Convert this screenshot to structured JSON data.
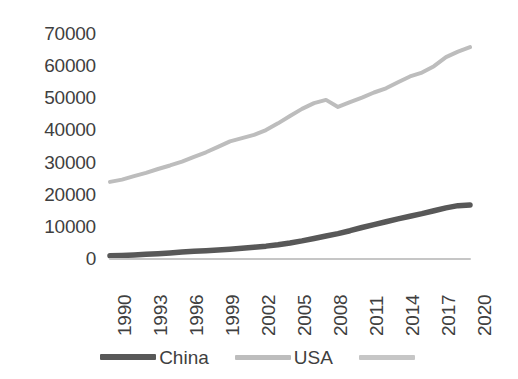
{
  "chart_data": {
    "type": "line",
    "title": "",
    "xlabel": "",
    "ylabel": "",
    "xlim": [
      1990,
      2020
    ],
    "ylim": [
      0,
      70000
    ],
    "grid": false,
    "legend_position": "bottom",
    "y_ticks": [
      70000,
      60000,
      50000,
      40000,
      30000,
      20000,
      10000,
      0
    ],
    "y_tick_labels": [
      "70000",
      "60000",
      "50000",
      "40000",
      "30000",
      "20000",
      "10000",
      "0"
    ],
    "x_ticks": [
      1990,
      1993,
      1996,
      1999,
      2002,
      2005,
      2008,
      2011,
      2014,
      2017,
      2020
    ],
    "x_tick_labels": [
      "1990",
      "1993",
      "1996",
      "1999",
      "2002",
      "2005",
      "2008",
      "2011",
      "2014",
      "2017",
      "2020"
    ],
    "x": [
      1990,
      1991,
      1992,
      1993,
      1994,
      1995,
      1996,
      1997,
      1998,
      1999,
      2000,
      2001,
      2002,
      2003,
      2004,
      2005,
      2006,
      2007,
      2008,
      2009,
      2010,
      2011,
      2012,
      2013,
      2014,
      2015,
      2016,
      2017,
      2018,
      2019,
      2020
    ],
    "series": [
      {
        "name": "China",
        "color": "#585858",
        "values": [
          1000,
          1100,
          1250,
          1450,
          1650,
          1900,
          2150,
          2400,
          2600,
          2800,
          3050,
          3350,
          3650,
          4000,
          4450,
          5000,
          5650,
          6400,
          7150,
          7900,
          8800,
          9800,
          10700,
          11600,
          12500,
          13300,
          14100,
          15000,
          15900,
          16600,
          16800
        ]
      },
      {
        "name": "USA",
        "color": "#bdbdbd",
        "values": [
          24000,
          24700,
          25800,
          26800,
          28000,
          29100,
          30300,
          31800,
          33200,
          34900,
          36600,
          37600,
          38600,
          40100,
          42200,
          44500,
          46700,
          48500,
          49500,
          47300,
          48800,
          50200,
          51800,
          53100,
          55000,
          56800,
          58000,
          60000,
          62800,
          64500,
          65900
        ]
      },
      {
        "name": "",
        "color": "#c6c6c6",
        "values": [
          0,
          0,
          0,
          0,
          0,
          0,
          0,
          0,
          0,
          0,
          0,
          0,
          0,
          0,
          0,
          0,
          0,
          0,
          0,
          0,
          0,
          0,
          0,
          0,
          0,
          0,
          0,
          0,
          0,
          0,
          0
        ]
      }
    ]
  },
  "legend": {
    "items": [
      {
        "label": "China",
        "swatch": "china"
      },
      {
        "label": "USA",
        "swatch": "usa"
      },
      {
        "label": "",
        "swatch": "other"
      }
    ]
  }
}
